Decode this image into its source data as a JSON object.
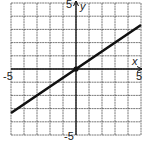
{
  "chart_data": {
    "type": "line",
    "title": "",
    "xlabel": "x",
    "ylabel": "y",
    "xlim": [
      -5,
      5
    ],
    "ylim": [
      -5,
      5
    ],
    "grid": true,
    "x_tick_labels": [
      "-5",
      "5"
    ],
    "y_tick_labels": [
      "5",
      "-5"
    ],
    "series": [
      {
        "name": "line",
        "equation": "y = (2/3)x",
        "x": [
          -5,
          0,
          5
        ],
        "y": [
          -3.33,
          0,
          3.33
        ]
      }
    ],
    "points": [
      {
        "x": 0,
        "y": 0
      }
    ]
  },
  "labels": {
    "x_axis": "x",
    "y_axis": "y",
    "x_min": "-5",
    "x_max": "5",
    "y_max": "5",
    "y_min": "-5"
  }
}
